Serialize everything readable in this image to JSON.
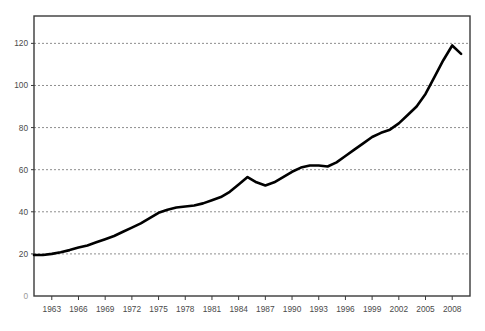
{
  "chart_data": {
    "type": "line",
    "title": "",
    "subtitle": "",
    "xlabel": "",
    "ylabel": "",
    "xlim": [
      1961,
      2010
    ],
    "ylim": [
      0,
      133
    ],
    "grid": true,
    "grid_axis": "y",
    "legend": null,
    "legend_position": "none",
    "yticks": [
      20,
      40,
      60,
      80,
      100,
      120
    ],
    "ytick_labels": [
      "20",
      "40",
      "60",
      "80",
      "100",
      "120"
    ],
    "origin_label": "0",
    "xticks": [
      1963,
      1966,
      1969,
      1972,
      1975,
      1978,
      1981,
      1984,
      1987,
      1990,
      1993,
      1996,
      1999,
      2002,
      2005,
      2008
    ],
    "xtick_labels": [
      "1963",
      "1966",
      "1969",
      "1972",
      "1975",
      "1978",
      "1981",
      "1984",
      "1987",
      "1990",
      "1993",
      "1996",
      "1999",
      "2002",
      "2005",
      "2008"
    ],
    "series": [
      {
        "name": "series-1",
        "color": "#000000",
        "line_width": 2.6,
        "x": [
          1961,
          1962,
          1963,
          1964,
          1965,
          1966,
          1967,
          1968,
          1969,
          1970,
          1971,
          1972,
          1973,
          1974,
          1975,
          1976,
          1977,
          1978,
          1979,
          1980,
          1981,
          1982,
          1983,
          1984,
          1985,
          1986,
          1987,
          1988,
          1989,
          1990,
          1991,
          1992,
          1993,
          1994,
          1995,
          1996,
          1997,
          1998,
          1999,
          2000,
          2001,
          2002,
          2003,
          2004,
          2005,
          2006,
          2007,
          2008,
          2009
        ],
        "values": [
          19.5,
          19.5,
          20.0,
          20.8,
          21.8,
          23.0,
          24.0,
          25.5,
          27.0,
          28.5,
          30.5,
          32.5,
          34.5,
          37.0,
          39.5,
          41.0,
          42.0,
          42.5,
          43.0,
          44.0,
          45.5,
          47.0,
          49.5,
          53.0,
          56.5,
          54.0,
          52.5,
          54.0,
          56.5,
          59.0,
          61.0,
          62.0,
          62.0,
          61.5,
          63.5,
          66.5,
          69.5,
          72.5,
          75.5,
          77.5,
          79.0,
          82.0,
          86.0,
          90.0,
          96.0,
          104.0,
          112.0,
          119.0,
          115.0
        ]
      }
    ]
  },
  "axes": {
    "frame_color": "#3a3a3a",
    "grid_color": "#8e8e8e",
    "grid_dash": "2,2"
  }
}
